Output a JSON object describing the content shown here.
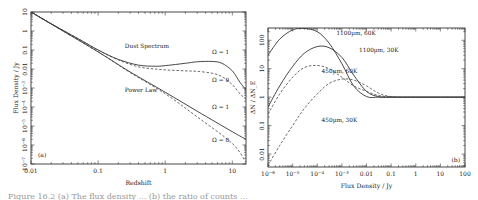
{
  "figure": {
    "caption_fragment": "Figure 16.2 (a) The flux density ... (b) the ratio of counts ..."
  },
  "chart_data": [
    {
      "panel": "(a)",
      "type": "line",
      "title": "",
      "xlabel": "Redshift",
      "ylabel": "Flux Density / Jy",
      "xscale": "log",
      "yscale": "log",
      "xlim": [
        0.01,
        16
      ],
      "ylim": [
        1e-07,
        10
      ],
      "xticks": [
        "0.01",
        "0.1",
        "1",
        "10"
      ],
      "yticks": [
        "10^-7",
        "10^-6",
        "10^-5",
        "10^-4",
        "10^-3",
        "0.01",
        "0.1",
        "1",
        "10"
      ],
      "grid": false,
      "annotations": [
        {
          "text": "Dust Spectrum",
          "x": 0.25,
          "y": 0.12
        },
        {
          "text": "Power Law",
          "x": 0.25,
          "y": 0.0006
        },
        {
          "text": "Ω = 1",
          "x": 5,
          "y": 0.06
        },
        {
          "text": "Ω = 0",
          "x": 5,
          "y": 0.002
        },
        {
          "text": "Ω = 1",
          "x": 5,
          "y": 8e-05
        },
        {
          "text": "Ω = 0",
          "x": 5,
          "y": 1.5e-06
        }
      ],
      "series": [
        {
          "name": "Dust Spectrum, Ω = 1",
          "style": "solid",
          "x": [
            0.01,
            0.02,
            0.05,
            0.1,
            0.2,
            0.4,
            0.7,
            1,
            2,
            3,
            5,
            7,
            10,
            13,
            16
          ],
          "y": [
            10,
            2.4,
            0.4,
            0.1,
            0.032,
            0.016,
            0.014,
            0.015,
            0.02,
            0.024,
            0.025,
            0.02,
            0.008,
            0.002,
            0.0008
          ]
        },
        {
          "name": "Dust Spectrum, Ω = 0",
          "style": "dashed",
          "x": [
            0.01,
            0.02,
            0.05,
            0.1,
            0.2,
            0.4,
            0.7,
            1,
            2,
            3,
            5,
            7,
            10,
            13,
            16
          ],
          "y": [
            10,
            2.4,
            0.4,
            0.1,
            0.03,
            0.013,
            0.01,
            0.009,
            0.008,
            0.0075,
            0.006,
            0.004,
            0.0015,
            0.0005,
            0.00025
          ]
        },
        {
          "name": "Power Law, Ω = 1",
          "style": "solid",
          "x": [
            0.01,
            0.03,
            0.1,
            0.3,
            1,
            3,
            10,
            16
          ],
          "y": [
            10,
            1.0,
            0.08,
            0.007,
            0.0006,
            6e-05,
            5e-06,
            2e-06
          ]
        },
        {
          "name": "Power Law, Ω = 0",
          "style": "dashed",
          "x": [
            0.01,
            0.03,
            0.1,
            0.3,
            1,
            3,
            10,
            16
          ],
          "y": [
            10,
            1.0,
            0.08,
            0.0065,
            0.0005,
            3e-05,
            1.2e-06,
            1.2e-07
          ]
        }
      ]
    },
    {
      "panel": "(b)",
      "type": "line",
      "title": "",
      "xlabel": "Flux Density / Jy",
      "ylabel": "ΔN / ΔN_E",
      "xscale": "log",
      "yscale": "log",
      "xlim": [
        1e-06,
        100
      ],
      "ylim": [
        0.0035,
        270
      ],
      "xticks": [
        "10^-6",
        "10^-5",
        "10^-4",
        "10^-3",
        "0.01",
        "0.1",
        "1",
        "10",
        "100"
      ],
      "yticks": [
        "0.01",
        "0.1",
        "1",
        "10",
        "100"
      ],
      "grid": false,
      "annotations": [
        {
          "text": "1100µm, 60K",
          "x": 0.0006,
          "y": 150
        },
        {
          "text": "1100µm, 30K",
          "x": 0.005,
          "y": 40
        },
        {
          "text": "450µm, 60K",
          "x": 0.00015,
          "y": 7
        },
        {
          "text": "450µm, 30K",
          "x": 0.00015,
          "y": 0.13
        }
      ],
      "series": [
        {
          "name": "1100µm, 60K",
          "style": "solid",
          "x": [
            1e-06,
            3e-06,
            1e-05,
            3e-05,
            0.0001,
            0.0003,
            0.001,
            0.003,
            0.01,
            0.03,
            0.1,
            1,
            10,
            100
          ],
          "y": [
            30,
            110,
            230,
            260,
            200,
            80,
            15,
            2.5,
            1.05,
            1.0,
            1.0,
            1.0,
            1.0,
            1.0
          ]
        },
        {
          "name": "1100µm, 30K",
          "style": "solid",
          "x": [
            1e-06,
            3e-06,
            1e-05,
            3e-05,
            0.0001,
            0.0003,
            0.001,
            0.003,
            0.01,
            0.03,
            0.1,
            1,
            10,
            100
          ],
          "y": [
            0.45,
            2.5,
            12,
            35,
            60,
            55,
            25,
            6,
            1.6,
            1.05,
            1.0,
            1.0,
            1.0,
            1.0
          ]
        },
        {
          "name": "450µm, 60K",
          "style": "dashed",
          "x": [
            1e-06,
            3e-06,
            1e-05,
            3e-05,
            0.0001,
            0.0003,
            0.001,
            0.003,
            0.01,
            0.03,
            0.1,
            1,
            10,
            100
          ],
          "y": [
            0.25,
            1.3,
            5,
            11,
            13,
            10,
            5,
            2.5,
            1.6,
            1.15,
            1.02,
            1.0,
            1.0,
            1.0
          ]
        },
        {
          "name": "450µm, 30K",
          "style": "dashed",
          "x": [
            1e-06,
            3e-06,
            1e-05,
            3e-05,
            0.0001,
            0.0003,
            0.001,
            0.003,
            0.01,
            0.03,
            0.1,
            1,
            10,
            100
          ],
          "y": [
            0.004,
            0.02,
            0.1,
            0.4,
            1.3,
            3,
            4.3,
            4,
            2.5,
            1.4,
            1.05,
            1.0,
            1.0,
            1.0
          ]
        }
      ],
      "panel_label_position": "bottom-right"
    }
  ]
}
